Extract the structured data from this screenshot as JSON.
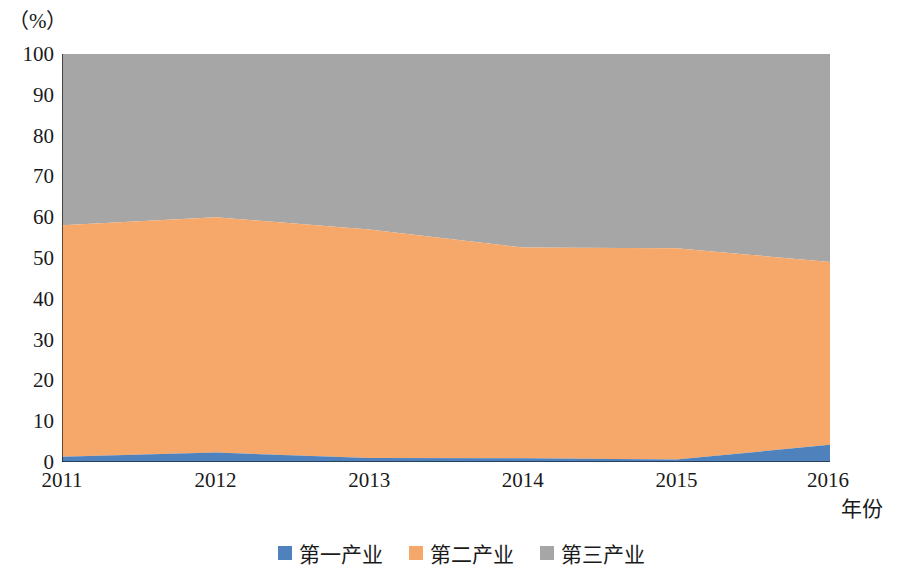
{
  "chart_data": {
    "type": "area",
    "stacked": true,
    "title": "",
    "unit_label": "（%）",
    "xlabel": "年份",
    "ylabel": "",
    "ylim": [
      0,
      100
    ],
    "yticks": [
      0,
      10,
      20,
      30,
      40,
      50,
      60,
      70,
      80,
      90,
      100
    ],
    "categories": [
      "2011",
      "2012",
      "2013",
      "2014",
      "2015",
      "2016"
    ],
    "grid": false,
    "legend_position": "bottom",
    "series": [
      {
        "name": "第一产业",
        "color": "#4f81bd",
        "values": [
          1.3,
          2.3,
          1.0,
          0.9,
          0.6,
          4.2
        ]
      },
      {
        "name": "第二产业",
        "color": "#f5a86a",
        "values": [
          56.7,
          57.7,
          56.0,
          51.7,
          51.8,
          44.8
        ]
      },
      {
        "name": "第三产业",
        "color": "#a6a6a6",
        "values": [
          42.0,
          40.0,
          43.0,
          47.4,
          47.6,
          51.0
        ]
      }
    ],
    "cumulative_top_lines": {
      "first_top": [
        1.3,
        2.3,
        1.0,
        0.9,
        0.6,
        4.2
      ],
      "second_top": [
        58.0,
        60.0,
        57.0,
        52.6,
        52.4,
        49.0
      ],
      "third_top": [
        100,
        100,
        100,
        100,
        100,
        100
      ]
    }
  },
  "axis": {
    "y_ticks": [
      "100",
      "90",
      "80",
      "70",
      "60",
      "50",
      "40",
      "30",
      "20",
      "10",
      "0"
    ],
    "x_ticks": [
      "2011",
      "2012",
      "2013",
      "2014",
      "2015",
      "2016"
    ],
    "x_axis_title": "年份",
    "unit": "（%）"
  },
  "legend": {
    "items": [
      {
        "label": "第一产业",
        "color": "#4f81bd"
      },
      {
        "label": "第二产业",
        "color": "#f5a86a"
      },
      {
        "label": "第三产业",
        "color": "#a6a6a6"
      }
    ]
  }
}
